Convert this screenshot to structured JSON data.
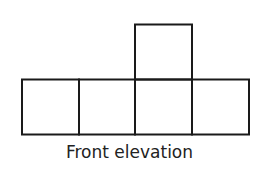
{
  "diagram": {
    "caption": "Front elevation",
    "stroke_color": "#1a1a1a",
    "squares": [
      {
        "row": "top",
        "col": 3
      },
      {
        "row": "bottom",
        "col": 1
      },
      {
        "row": "bottom",
        "col": 2
      },
      {
        "row": "bottom",
        "col": 3
      },
      {
        "row": "bottom",
        "col": 4
      }
    ]
  }
}
